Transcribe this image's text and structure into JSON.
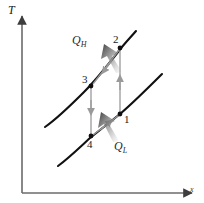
{
  "figure": {
    "axes": {
      "y_label": "T",
      "x_label": "x",
      "y_axis_name": "temperature-axis",
      "x_axis_name": "entropy-axis",
      "axis_color": "#6b6b6b"
    },
    "state_points": [
      {
        "id": "1",
        "label": "1",
        "x": 120,
        "y": 114
      },
      {
        "id": "2",
        "label": "2",
        "x": 120,
        "y": 48
      },
      {
        "id": "3",
        "label": "3",
        "x": 91,
        "y": 86
      },
      {
        "id": "4",
        "label": "4",
        "x": 91,
        "y": 136
      }
    ],
    "processes": [
      {
        "name": "process-1-to-2",
        "from": "1",
        "to": "2",
        "kind": "vertical-up",
        "color": "#9a9a9a"
      },
      {
        "name": "process-3-to-4",
        "from": "3",
        "to": "4",
        "kind": "vertical-down",
        "color": "#9a9a9a"
      },
      {
        "name": "process-2-to-3",
        "from": "2",
        "to": "3",
        "kind": "diagonal-down-left",
        "color": "#9a9a9a"
      },
      {
        "name": "process-4-to-1",
        "from": "4",
        "to": "1",
        "kind": "diagonal-up-right",
        "color": "#9a9a9a"
      }
    ],
    "curves": [
      {
        "name": "upper-isobar-curve",
        "color": "#111111",
        "description": "curve through state 3 rising to state 2"
      },
      {
        "name": "lower-isobar-curve",
        "color": "#111111",
        "description": "curve through state 4 rising to state 1"
      }
    ],
    "heat_flows": [
      {
        "name": "heat-rejected",
        "label": "Q",
        "subscript": "H",
        "direction": "out-up-left",
        "color": "#4a4a4a"
      },
      {
        "name": "heat-absorbed",
        "label": "Q",
        "subscript": "L",
        "direction": "in-up-left",
        "color": "#4a4a4a"
      }
    ]
  }
}
